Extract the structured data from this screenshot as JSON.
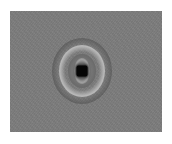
{
  "image": {
    "description": "Grayscale diffraction/interference ring pattern with dark core on gray noisy background",
    "colors": {
      "background": "#7d7d7d",
      "core": "#050505",
      "bright_ring": "#b8b8b8",
      "dark_halo": "#3c3c3c",
      "page": "#ffffff"
    }
  }
}
